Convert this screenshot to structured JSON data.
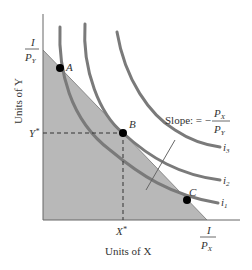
{
  "diagram": {
    "axes": {
      "x_label": "Units of X",
      "y_label": "Units of Y",
      "x_intercept": {
        "numerator": "I",
        "denominator": "P",
        "denominator_sub": "X"
      },
      "y_intercept": {
        "numerator": "I",
        "denominator": "P",
        "denominator_sub": "Y"
      },
      "x_star": "X*",
      "x_star_base": "X",
      "y_star": "Y*",
      "y_star_base": "Y",
      "star": "*"
    },
    "points": [
      {
        "label": "A"
      },
      {
        "label": "B"
      },
      {
        "label": "C"
      }
    ],
    "curves": [
      {
        "label": "i",
        "sub": "1"
      },
      {
        "label": "i",
        "sub": "2"
      },
      {
        "label": "i",
        "sub": "3"
      }
    ],
    "slope_annotation": {
      "prefix": "Slope: = −",
      "numerator": "P",
      "numerator_sub": "X",
      "denominator": "P",
      "denominator_sub": "Y"
    },
    "colors": {
      "feasible_region": "#b8b8b8",
      "curve": "#7a7a7a",
      "axis": "#666666",
      "point": "#000000"
    }
  }
}
